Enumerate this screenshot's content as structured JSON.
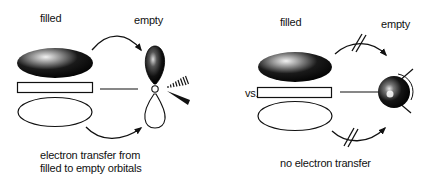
{
  "left_panel": {
    "label_filled": "filled",
    "label_empty": "empty",
    "caption_line1": "electron transfer from",
    "caption_line2": "filled to empty orbitals",
    "arrows": [
      "curved-arrow-top",
      "curved-arrow-bottom"
    ],
    "acceptor": "p-orbital"
  },
  "separator": {
    "label": "vs."
  },
  "right_panel": {
    "label_filled": "filled",
    "label_empty": "empty",
    "caption": "no electron transfer",
    "arrows": [
      "blocked-arrow-top",
      "blocked-arrow-bottom"
    ],
    "acceptor": "s-orbital-sphere"
  },
  "colors": {
    "ink": "#111111",
    "background": "#ffffff"
  }
}
